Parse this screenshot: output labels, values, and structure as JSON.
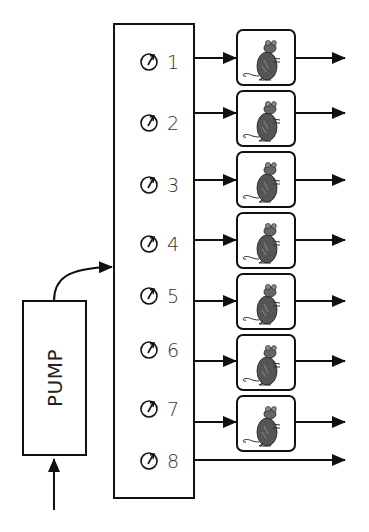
{
  "pump": {
    "label": "PUMP"
  },
  "manifold": {
    "channels": [
      {
        "number": "1",
        "has_subject": true
      },
      {
        "number": "2",
        "has_subject": true
      },
      {
        "number": "3",
        "has_subject": true
      },
      {
        "number": "4",
        "has_subject": true
      },
      {
        "number": "5",
        "has_subject": true
      },
      {
        "number": "6",
        "has_subject": true
      },
      {
        "number": "7",
        "has_subject": true
      },
      {
        "number": "8",
        "has_subject": false
      }
    ]
  },
  "icons": {
    "dial": "flow-meter-dial-icon",
    "subject": "rat-icon"
  },
  "colors": {
    "stroke": "#1a1a1a",
    "background": "#ffffff"
  }
}
